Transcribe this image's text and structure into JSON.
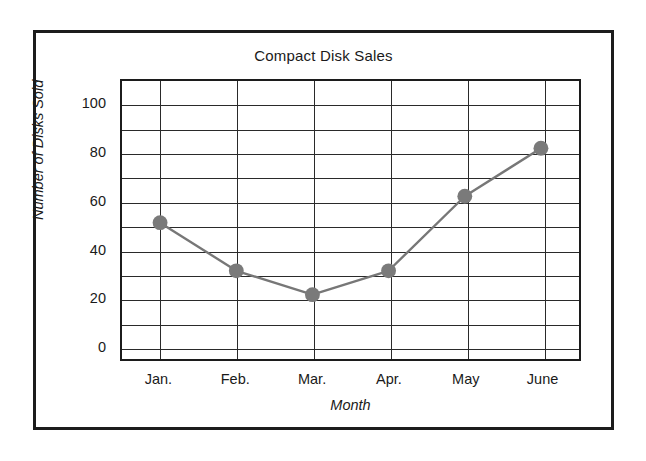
{
  "chart_data": {
    "type": "line",
    "title": "Compact Disk Sales",
    "xlabel": "Month",
    "ylabel": "Number of Disks Sold",
    "categories": [
      "Jan.",
      "Feb.",
      "Mar.",
      "Apr.",
      "May",
      "June"
    ],
    "values": [
      51,
      31,
      21,
      31,
      62,
      82
    ],
    "ylim": [
      0,
      110
    ],
    "ytick_labels": [
      "0",
      "20",
      "40",
      "60",
      "80",
      "100"
    ],
    "ytick_values": [
      0,
      20,
      40,
      60,
      80,
      100
    ],
    "gridline_values": [
      0,
      10,
      20,
      30,
      40,
      50,
      60,
      70,
      80,
      90,
      100,
      110
    ],
    "grid": "on",
    "legend": "none",
    "marker": "filled-circle",
    "marker_color": "#7a7a7a",
    "line_color": "#777777",
    "grid_color": "#2a2a2a",
    "frame_color": "#1c1c1c",
    "background_color": "#ffffff"
  }
}
